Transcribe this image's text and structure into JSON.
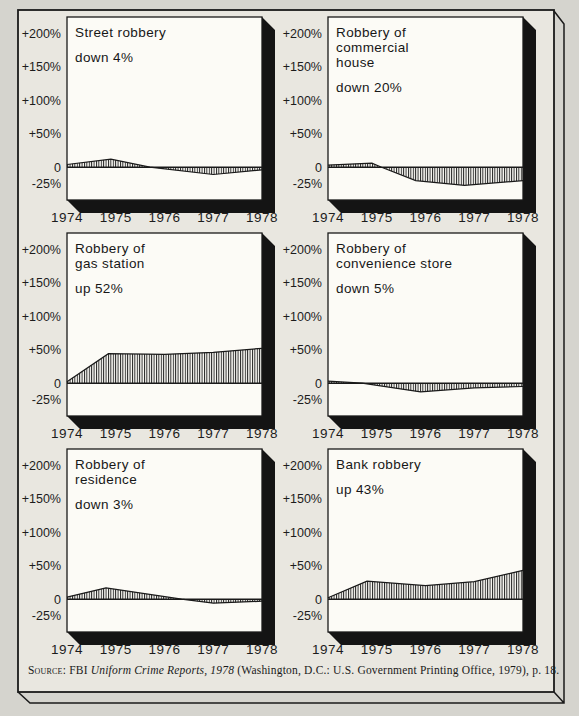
{
  "colors": {
    "background": "#d5d4ce",
    "paper": "#e9e7e0",
    "plot_background": "#fcfbf6",
    "ink": "#1a1a1a",
    "shadow": "#141414"
  },
  "axis": {
    "y_ticks": [
      "+200%",
      "+150%",
      "+100%",
      "+50%",
      "0",
      "-25%"
    ],
    "y_values": [
      200,
      150,
      100,
      50,
      0,
      -25
    ],
    "x_ticks": [
      "1974",
      "1975",
      "1976",
      "1977",
      "1978"
    ],
    "x_values": [
      1974,
      1975,
      1976,
      1977,
      1978
    ],
    "ylim": [
      -49,
      224
    ],
    "xlim": [
      1974,
      1978
    ]
  },
  "chart_data": [
    {
      "id": "street-robbery",
      "type": "area",
      "title": "Street robbery",
      "title_lines": [
        "Street robbery"
      ],
      "caption": "down 4%",
      "change_pct": -4,
      "hatch": "vertical",
      "x": [
        1974,
        1974.9,
        1975.7,
        1977,
        1978
      ],
      "y": [
        4,
        12,
        0,
        -11,
        -4
      ]
    },
    {
      "id": "commercial-house",
      "type": "area",
      "title": "Robbery of commercial house",
      "title_lines": [
        "Robbery of",
        "commercial",
        "house"
      ],
      "caption": "down 20%",
      "change_pct": -20,
      "hatch": "vertical",
      "x": [
        1974,
        1974.9,
        1975.1,
        1975.8,
        1976.8,
        1978
      ],
      "y": [
        3,
        6,
        0,
        -20,
        -27,
        -20
      ]
    },
    {
      "id": "gas-station",
      "type": "area",
      "title": "Robbery of gas station",
      "title_lines": [
        "Robbery of",
        "gas station"
      ],
      "caption": "up 52%",
      "change_pct": 52,
      "hatch": "vertical",
      "x": [
        1974,
        1974.85,
        1976,
        1977,
        1978
      ],
      "y": [
        2,
        44,
        43,
        46,
        52
      ]
    },
    {
      "id": "convenience-store",
      "type": "area",
      "title": "Robbery of convenience store",
      "title_lines": [
        "Robbery of",
        "convenience store"
      ],
      "caption": "down 5%",
      "change_pct": -5,
      "hatch": "vertical",
      "x": [
        1974,
        1974.7,
        1975.9,
        1977,
        1978
      ],
      "y": [
        3,
        0,
        -13,
        -7,
        -5
      ]
    },
    {
      "id": "residence",
      "type": "area",
      "title": "Robbery of residence",
      "title_lines": [
        "Robbery of",
        "residence"
      ],
      "caption": "down 3%",
      "change_pct": -3,
      "hatch": "vertical",
      "x": [
        1974,
        1974.8,
        1976.35,
        1977,
        1978
      ],
      "y": [
        3,
        17,
        0,
        -6,
        -3
      ]
    },
    {
      "id": "bank-robbery",
      "type": "area",
      "title": "Bank robbery",
      "title_lines": [
        "Bank robbery"
      ],
      "caption": "up 43%",
      "change_pct": 43,
      "hatch": "vertical",
      "x": [
        1974,
        1974.8,
        1976,
        1977,
        1978
      ],
      "y": [
        2,
        27,
        20,
        26,
        43
      ]
    }
  ],
  "source": {
    "parts": [
      {
        "t": "Source:"
      },
      {
        "t": " FBI "
      },
      {
        "t": "Uniform Crime Reports, 1978",
        "italic": true
      },
      {
        "t": " (Washington, D.C.: U.S. Government Printing Office, 1979), p. 18."
      }
    ]
  }
}
